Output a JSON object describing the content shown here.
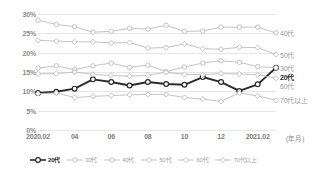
{
  "chart_data": {
    "type": "line",
    "title": "",
    "xlabel": "(年月)",
    "ylabel": "",
    "ylim": [
      0,
      30
    ],
    "yunit": "%",
    "ytick_labels": [
      "0%",
      "5%",
      "10%",
      "15%",
      "20%",
      "25%",
      "30%"
    ],
    "ytick_values": [
      0,
      5,
      10,
      15,
      20,
      25,
      30
    ],
    "grid": true,
    "legend_position": "bottom",
    "x": [
      "2020.02",
      "2020.03",
      "2020.04",
      "2020.05",
      "2020.06",
      "2020.07",
      "2020.08",
      "2020.09",
      "2020.10",
      "2020.11",
      "2020.12",
      "2021.01",
      "2021.02",
      "2021.03"
    ],
    "xtick_labels": [
      "2020.02",
      "04",
      "06",
      "08",
      "10",
      "12",
      "2021.02"
    ],
    "xtick_indices": [
      0,
      2,
      4,
      6,
      8,
      10,
      12
    ],
    "series": [
      {
        "name": "20代",
        "values": [
          9.6,
          9.9,
          10.7,
          13.1,
          12.4,
          11.5,
          12.4,
          11.9,
          11.7,
          13.7,
          12.4,
          10.1,
          11.8,
          16.1
        ],
        "highlight": true
      },
      {
        "name": "30代",
        "values": [
          16.0,
          16.6,
          15.6,
          16.6,
          17.3,
          16.2,
          16.8,
          15.1,
          16.3,
          17.3,
          17.9,
          17.5,
          16.4,
          16.1
        ],
        "highlight": false
      },
      {
        "name": "40代",
        "values": [
          28.4,
          27.3,
          26.7,
          25.3,
          25.5,
          26.3,
          26.1,
          27.1,
          25.5,
          25.6,
          26.6,
          26.6,
          26.6,
          25.1
        ],
        "highlight": false
      },
      {
        "name": "50代",
        "values": [
          23.2,
          23.0,
          22.8,
          22.8,
          22.5,
          22.6,
          21.2,
          21.3,
          22.3,
          21.0,
          20.9,
          21.4,
          21.3,
          19.5
        ],
        "highlight": false
      },
      {
        "name": "60代",
        "values": [
          14.5,
          14.6,
          15.0,
          14.4,
          14.1,
          13.9,
          14.2,
          14.9,
          14.4,
          14.3,
          14.6,
          14.5,
          14.3,
          13.4
        ],
        "highlight": false
      },
      {
        "name": "70代以上",
        "values": [
          9.4,
          9.6,
          8.4,
          8.7,
          8.9,
          9.1,
          9.2,
          9.2,
          8.4,
          8.0,
          7.4,
          9.6,
          8.8,
          7.7
        ],
        "highlight": false
      }
    ],
    "right_labels": [
      {
        "name": "40代",
        "value": 25.1
      },
      {
        "name": "50代",
        "value": 19.5
      },
      {
        "name": "30代",
        "value": 16.1
      },
      {
        "name": "20代",
        "value": 16.1
      },
      {
        "name": "60代",
        "value": 13.4
      },
      {
        "name": "70代以上",
        "value": 7.7
      }
    ],
    "legend": [
      "20代",
      "30代",
      "40代",
      "50代",
      "60代",
      "70代以上"
    ],
    "colors": {
      "highlight": "#2b2b2b",
      "normal": "#b4b4b4",
      "grid": "#e6e6e6",
      "text": "#8a8a8a",
      "background": "#ffffff"
    },
    "markers": {
      "20代": "circle",
      "30代": "circle",
      "40代": "circle",
      "50代": "diamond",
      "60代": "diamond",
      "70代以上": "diamond"
    }
  }
}
